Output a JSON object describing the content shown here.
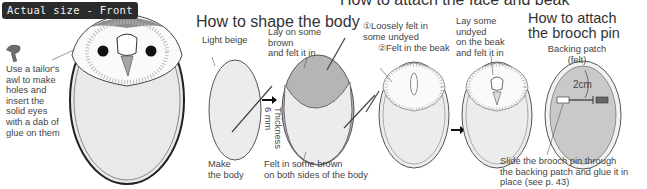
{
  "badge": {
    "label": "Actual size - Front"
  },
  "left_panel": {
    "awl_note": "Use a tailor's\nawl to make\nholes and\ninsert the\nsolid eyes\nwith a dab of\nglue on them",
    "icons": [
      "awl-icon"
    ]
  },
  "section_body": {
    "title": "How to shape the body",
    "labels": {
      "light_beige": "Light beige",
      "lay_brown": "Lay on some\nbrown\nand felt it in",
      "make_body": "Make\nthe body",
      "thickness": "Thickness\n6 mm",
      "felt_sides": "Felt in some brown\non both sides of the body"
    }
  },
  "section_face": {
    "title": "How to attach the face and beak",
    "labels": {
      "step1": "①Loosely felt in\nsome undyed",
      "step2": "②Felt in the beak",
      "lay_undyed": "Lay some\nundyed\non the beak\nand felt it in"
    }
  },
  "section_brooch": {
    "title": "How to attach\nthe brooch pin",
    "labels": {
      "backing_patch": "Backing patch\n(felt)",
      "measure": "2cm",
      "slide_note": "Slide the brooch pin through\nthe backing patch and glue it in\nplace (see p. 43)"
    }
  },
  "colors": {
    "light_beige": "#ececec",
    "brown": "#a9a9a9",
    "outline": "#4a4a4a",
    "badge_bg": "#2b2b2b"
  }
}
